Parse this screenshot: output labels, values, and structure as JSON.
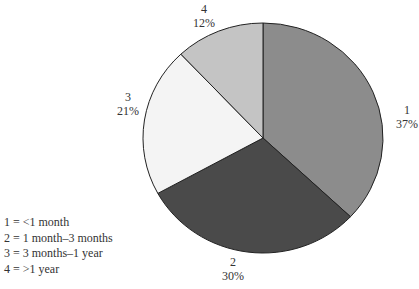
{
  "chart_data": {
    "type": "pie",
    "title": "",
    "categories": [
      "1",
      "2",
      "3",
      "4"
    ],
    "values": [
      37,
      30,
      21,
      12
    ],
    "labels": [
      "37%",
      "30%",
      "21%",
      "12%"
    ],
    "colors": [
      "#8c8c8c",
      "#4a4a4a",
      "#f4f4f4",
      "#c4c4c4"
    ],
    "legend": [
      "1 = <1 month",
      "2 = 1 month–3 months",
      "3 = 3 months–1 year",
      "4 = >1 year"
    ],
    "legend_position": "bottom-left"
  },
  "slices": [
    {
      "id": "1",
      "pct": "37%"
    },
    {
      "id": "2",
      "pct": "30%"
    },
    {
      "id": "3",
      "pct": "21%"
    },
    {
      "id": "4",
      "pct": "12%"
    }
  ]
}
